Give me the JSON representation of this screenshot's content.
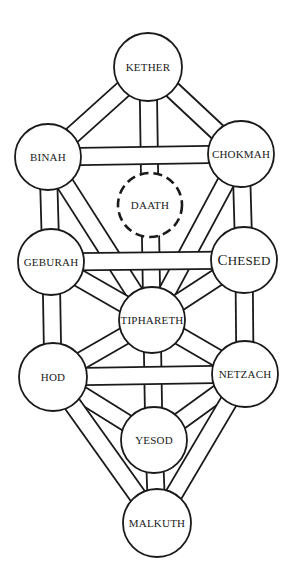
{
  "diagram": {
    "colors": {
      "stroke": "#1a1a1a",
      "fill": "#ffffff",
      "background": "#ffffff"
    },
    "channel_width": 17,
    "nodes": [
      {
        "id": "kether",
        "label": "KETHER",
        "cx": 148,
        "cy": 67,
        "r": 34,
        "style": "solid"
      },
      {
        "id": "binah",
        "label": "BINAH",
        "cx": 48,
        "cy": 157,
        "r": 33,
        "style": "solid"
      },
      {
        "id": "chokmah",
        "label": "CHOKMAH",
        "cx": 241,
        "cy": 154,
        "r": 33,
        "style": "solid"
      },
      {
        "id": "daath",
        "label": "DAATH",
        "cx": 150,
        "cy": 205,
        "r": 32,
        "style": "dashed"
      },
      {
        "id": "geburah",
        "label": "GEBURAH",
        "cx": 51,
        "cy": 262,
        "r": 33,
        "style": "solid"
      },
      {
        "id": "chesed",
        "label": "CHESED",
        "cx": 244,
        "cy": 260,
        "r": 33,
        "style": "solid"
      },
      {
        "id": "tiphareth",
        "label": "TIPHARETH",
        "cx": 152,
        "cy": 320,
        "r": 33,
        "style": "solid"
      },
      {
        "id": "hod",
        "label": "HOD",
        "cx": 53,
        "cy": 377,
        "r": 34,
        "style": "solid"
      },
      {
        "id": "netzach",
        "label": "NETZACH",
        "cx": 245,
        "cy": 374,
        "r": 33,
        "style": "solid"
      },
      {
        "id": "yesod",
        "label": "YESOD",
        "cx": 154,
        "cy": 440,
        "r": 33,
        "style": "solid"
      },
      {
        "id": "malkuth",
        "label": "MALKUTH",
        "cx": 157,
        "cy": 523,
        "r": 34,
        "style": "solid"
      }
    ],
    "paths": [
      [
        "kether",
        "binah"
      ],
      [
        "kether",
        "chokmah"
      ],
      [
        "kether",
        "daath"
      ],
      [
        "daath",
        "tiphareth"
      ],
      [
        "chokmah",
        "chesed"
      ],
      [
        "chokmah",
        "tiphareth"
      ],
      [
        "binah",
        "geburah"
      ],
      [
        "binah",
        "tiphareth"
      ],
      [
        "chesed",
        "tiphareth"
      ],
      [
        "chesed",
        "netzach"
      ],
      [
        "geburah",
        "tiphareth"
      ],
      [
        "geburah",
        "hod"
      ],
      [
        "tiphareth",
        "netzach"
      ],
      [
        "tiphareth",
        "hod"
      ],
      [
        "tiphareth",
        "yesod"
      ],
      [
        "netzach",
        "yesod"
      ],
      [
        "netzach",
        "malkuth"
      ],
      [
        "hod",
        "yesod"
      ],
      [
        "hod",
        "malkuth"
      ],
      [
        "yesod",
        "malkuth"
      ],
      [
        "binah",
        "chokmah"
      ],
      [
        "geburah",
        "chesed"
      ],
      [
        "hod",
        "netzach"
      ]
    ]
  }
}
